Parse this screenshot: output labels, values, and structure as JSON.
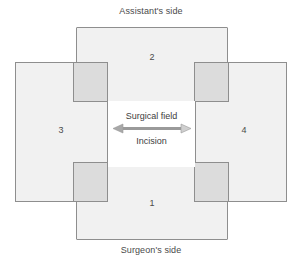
{
  "diagram": {
    "captions": {
      "top": "Assistant's side",
      "bottom": "Surgeon's side"
    },
    "center": {
      "field_label": "Surgical field",
      "incision_label": "Incision",
      "arrow": "double-headed-horizontal-arrow"
    },
    "sheets": [
      {
        "id": "bottom",
        "number": "1",
        "position": "bottom",
        "side": "Surgeon's side"
      },
      {
        "id": "top",
        "number": "2",
        "position": "top",
        "side": "Assistant's side"
      },
      {
        "id": "left",
        "number": "3",
        "position": "left",
        "side": ""
      },
      {
        "id": "right",
        "number": "4",
        "position": "right",
        "side": ""
      }
    ],
    "watermark": "SSISTING OF",
    "colors": {
      "sheet_fill": "#f1f1f1",
      "sheet_border": "#8e8e8e",
      "overlap_fill": "#dcdcdc",
      "field_fill": "#ffffff",
      "text": "#4a4a4a",
      "arrow": "#9a9a9a",
      "background": "#ffffff"
    }
  }
}
